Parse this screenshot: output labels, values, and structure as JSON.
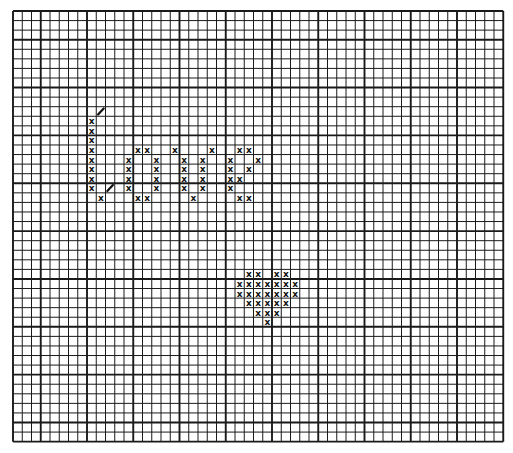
{
  "chart_data": {
    "type": "heatmap",
    "title": "",
    "grid": {
      "columns": 53,
      "rows": 45,
      "origin_px": [
        13,
        11
      ],
      "cell_px": [
        9.25,
        9.57
      ],
      "heavy_line_cols": [
        0,
        3,
        8,
        13,
        18,
        23,
        28,
        33,
        38,
        43,
        48,
        53
      ],
      "heavy_line_rows": [
        0,
        3,
        8,
        13,
        18,
        23,
        28,
        33,
        38,
        43,
        45
      ]
    },
    "legend": [
      {
        "symbol": "x",
        "meaning": "cross stitch"
      },
      {
        "symbol": "/",
        "meaning": "half stitch"
      }
    ],
    "cross_stitches": [
      [
        8,
        11
      ],
      [
        8,
        12
      ],
      [
        8,
        13
      ],
      [
        8,
        14
      ],
      [
        8,
        15
      ],
      [
        8,
        16
      ],
      [
        8,
        17
      ],
      [
        8,
        18
      ],
      [
        9,
        19
      ],
      [
        13,
        14
      ],
      [
        14,
        14
      ],
      [
        12,
        15
      ],
      [
        12,
        16
      ],
      [
        12,
        17
      ],
      [
        12,
        18
      ],
      [
        15,
        15
      ],
      [
        15,
        16
      ],
      [
        15,
        17
      ],
      [
        15,
        18
      ],
      [
        13,
        19
      ],
      [
        14,
        19
      ],
      [
        17,
        14
      ],
      [
        18,
        15
      ],
      [
        18,
        16
      ],
      [
        18,
        17
      ],
      [
        18,
        18
      ],
      [
        20,
        15
      ],
      [
        20,
        16
      ],
      [
        20,
        17
      ],
      [
        20,
        18
      ],
      [
        19,
        19
      ],
      [
        21,
        14
      ],
      [
        24,
        14
      ],
      [
        25,
        14
      ],
      [
        23,
        15
      ],
      [
        23,
        16
      ],
      [
        23,
        17
      ],
      [
        23,
        18
      ],
      [
        26,
        15
      ],
      [
        25,
        16
      ],
      [
        24,
        17
      ],
      [
        24,
        19
      ],
      [
        25,
        19
      ],
      [
        25,
        27
      ],
      [
        26,
        27
      ],
      [
        28,
        27
      ],
      [
        29,
        27
      ],
      [
        24,
        28
      ],
      [
        25,
        28
      ],
      [
        26,
        28
      ],
      [
        27,
        28
      ],
      [
        28,
        28
      ],
      [
        29,
        28
      ],
      [
        30,
        28
      ],
      [
        24,
        29
      ],
      [
        25,
        29
      ],
      [
        26,
        29
      ],
      [
        27,
        29
      ],
      [
        28,
        29
      ],
      [
        29,
        29
      ],
      [
        30,
        29
      ],
      [
        25,
        30
      ],
      [
        26,
        30
      ],
      [
        27,
        30
      ],
      [
        28,
        30
      ],
      [
        29,
        30
      ],
      [
        26,
        31
      ],
      [
        27,
        31
      ],
      [
        28,
        31
      ],
      [
        27,
        32
      ]
    ],
    "half_stitches": [
      [
        9,
        10
      ],
      [
        10,
        18
      ]
    ]
  },
  "colors": {
    "grid_line": "#1a1a1a",
    "stitch": "#111111",
    "background": "#ffffff"
  }
}
